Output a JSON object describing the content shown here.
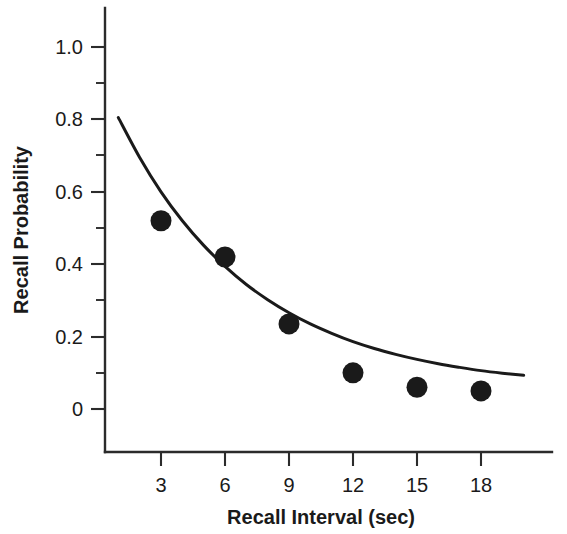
{
  "chart_data": {
    "type": "scatter",
    "title": "",
    "subtitle": "",
    "xlabel": "Recall Interval (sec)",
    "ylabel": "Recall Probability",
    "x": [
      3,
      6,
      9,
      12,
      15,
      18
    ],
    "values": [
      0.52,
      0.42,
      0.235,
      0.1,
      0.06,
      0.05
    ],
    "series": [
      {
        "name": "Observed recall probability",
        "marker": "filled-circle",
        "color": "#1a1a1a",
        "x": [
          3,
          6,
          9,
          12,
          15,
          18
        ],
        "values": [
          0.52,
          0.42,
          0.235,
          0.1,
          0.06,
          0.05
        ]
      },
      {
        "name": "Fitted exponential decay curve",
        "type": "line",
        "color": "#1a1a1a",
        "x": [
          1.0,
          2.0,
          3.0,
          4.0,
          5.0,
          6.0,
          7.0,
          8.0,
          9.0,
          10.0,
          11.0,
          12.0,
          13.0,
          14.0,
          15.0,
          16.0,
          17.0,
          18.0,
          19.0,
          20.0
        ],
        "values": [
          0.805,
          0.695,
          0.6,
          0.52,
          0.452,
          0.394,
          0.344,
          0.302,
          0.266,
          0.235,
          0.209,
          0.186,
          0.167,
          0.151,
          0.137,
          0.125,
          0.115,
          0.106,
          0.099,
          0.093
        ]
      }
    ],
    "xlim": [
      0.0,
      21.0
    ],
    "ylim": [
      -0.12,
      1.14
    ],
    "xticks": [
      3,
      6,
      9,
      12,
      15,
      18
    ],
    "xtick_labels": [
      "3",
      "6",
      "9",
      "12",
      "15",
      "18"
    ],
    "yticks": [
      0,
      0.2,
      0.4,
      0.6,
      0.8,
      1.0
    ],
    "ytick_labels": [
      "0",
      "0.2",
      "0.4",
      "0.6",
      "0.8",
      "1.0"
    ],
    "yticks_minor": [
      0.1,
      0.3,
      0.5,
      0.7,
      0.9
    ],
    "grid": false,
    "legend": "none",
    "annotations": []
  },
  "axes": {
    "y_title": "Recall Probability",
    "x_title": "Recall Interval (sec)",
    "y_labels": [
      "1.0",
      "0.8",
      "0.6",
      "0.4",
      "0.2",
      "0"
    ],
    "x_labels": [
      "3",
      "6",
      "9",
      "12",
      "15",
      "18"
    ]
  },
  "colors": {
    "background": "#ffffff",
    "ink": "#1a1a1a",
    "axis": "#2b2b2b"
  }
}
